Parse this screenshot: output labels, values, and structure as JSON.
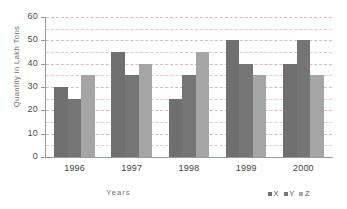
{
  "chart_data": {
    "type": "bar",
    "title": "",
    "subtitle": "",
    "xlabel": "Years",
    "ylabel": "Quantity in Lakh Tons",
    "categories": [
      "1996",
      "1997",
      "1998",
      "1999",
      "2000"
    ],
    "series": [
      {
        "name": "X",
        "values": [
          30,
          45,
          25,
          50,
          40
        ],
        "color": "#706f6f"
      },
      {
        "name": "Y",
        "values": [
          25,
          35,
          35,
          40,
          50
        ],
        "color": "#767575"
      },
      {
        "name": "Z",
        "values": [
          35,
          40,
          45,
          35,
          35
        ],
        "color": "#a6a5a5"
      }
    ],
    "ylim": [
      0,
      60
    ],
    "ytick_values": [
      0,
      10,
      20,
      30,
      40,
      50,
      60
    ],
    "ytick_labels": [
      "0",
      "10",
      "20",
      "30",
      "40",
      "50",
      "60"
    ],
    "gridline_values": [
      5,
      10,
      15,
      20,
      25,
      30,
      35,
      40,
      45,
      50,
      55,
      60
    ],
    "grid": true,
    "grid_color": "#e8c9cb",
    "legend_position": "bottom-right",
    "legend_entries": [
      "X",
      "Y",
      "Z"
    ],
    "axis_color": "#9a9a9a",
    "background": "#ffffff"
  }
}
